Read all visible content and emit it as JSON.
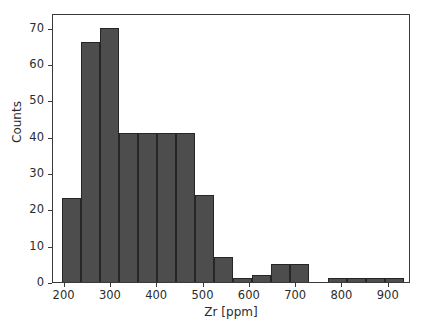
{
  "chart_data": {
    "type": "bar",
    "title": "",
    "subtitle": "",
    "xlabel": "Zr [ppm]",
    "ylabel": "Counts",
    "xlim": [
      175,
      948
    ],
    "ylim": [
      0,
      74
    ],
    "grid": false,
    "legend": null,
    "bar_color": "#4d4d4d",
    "edge_color": "#262626",
    "background_color": "#ffffff",
    "frame": true,
    "bin_width": 41,
    "xticks": [
      200,
      300,
      400,
      500,
      600,
      700,
      800,
      900
    ],
    "xtick_labels": [
      "200",
      "300",
      "400",
      "500",
      "600",
      "700",
      "800",
      "900"
    ],
    "yticks": [
      0,
      10,
      20,
      30,
      40,
      50,
      60,
      70
    ],
    "ytick_labels": [
      "0",
      "10",
      "20",
      "30",
      "40",
      "50",
      "60",
      "70"
    ],
    "bins": [
      {
        "left": 195,
        "right": 236,
        "value": 23
      },
      {
        "left": 236,
        "right": 277,
        "value": 66
      },
      {
        "left": 277,
        "right": 318,
        "value": 70
      },
      {
        "left": 318,
        "right": 359,
        "value": 41
      },
      {
        "left": 359,
        "right": 400,
        "value": 41
      },
      {
        "left": 400,
        "right": 441,
        "value": 41
      },
      {
        "left": 441,
        "right": 482,
        "value": 41
      },
      {
        "left": 482,
        "right": 523,
        "value": 24
      },
      {
        "left": 523,
        "right": 564,
        "value": 7
      },
      {
        "left": 564,
        "right": 605,
        "value": 1
      },
      {
        "left": 605,
        "right": 646,
        "value": 2
      },
      {
        "left": 646,
        "right": 687,
        "value": 5
      },
      {
        "left": 687,
        "right": 728,
        "value": 5
      },
      {
        "left": 728,
        "right": 769,
        "value": 0
      },
      {
        "left": 769,
        "right": 810,
        "value": 1
      },
      {
        "left": 810,
        "right": 851,
        "value": 1
      },
      {
        "left": 851,
        "right": 892,
        "value": 1
      },
      {
        "left": 892,
        "right": 933,
        "value": 1
      }
    ],
    "categories": [
      "195-236",
      "236-277",
      "277-318",
      "318-359",
      "359-400",
      "400-441",
      "441-482",
      "482-523",
      "523-564",
      "564-605",
      "605-646",
      "646-687",
      "687-728",
      "728-769",
      "769-810",
      "810-851",
      "851-892",
      "892-933"
    ],
    "values": [
      23,
      66,
      70,
      41,
      41,
      41,
      41,
      24,
      7,
      1,
      2,
      5,
      5,
      0,
      1,
      1,
      1,
      1
    ]
  }
}
